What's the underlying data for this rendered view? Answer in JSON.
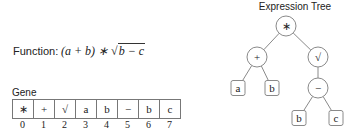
{
  "function": {
    "label": "Function:",
    "expression_prefix": "(a + b) ∗ ",
    "sqrt_symbol": "√",
    "radicand": "b − c"
  },
  "gene": {
    "title": "Gene",
    "cells": [
      "∗",
      "+",
      "√",
      "a",
      "b",
      "−",
      "b",
      "c"
    ],
    "indices": [
      "0",
      "1",
      "2",
      "3",
      "4",
      "5",
      "6",
      "7"
    ]
  },
  "tree": {
    "title": "Expression Tree",
    "nodes": [
      {
        "id": "root",
        "label": "∗",
        "shape": "circle",
        "x": 286,
        "y": 26
      },
      {
        "id": "plus",
        "label": "+",
        "shape": "circle",
        "x": 257,
        "y": 57
      },
      {
        "id": "sqrt",
        "label": "√",
        "shape": "circle",
        "x": 318,
        "y": 57
      },
      {
        "id": "a",
        "label": "a",
        "shape": "box",
        "x": 238,
        "y": 88
      },
      {
        "id": "b1",
        "label": "b",
        "shape": "box",
        "x": 272,
        "y": 88
      },
      {
        "id": "minus",
        "label": "−",
        "shape": "circle",
        "x": 318,
        "y": 88
      },
      {
        "id": "b2",
        "label": "b",
        "shape": "box",
        "x": 299,
        "y": 118
      },
      {
        "id": "c",
        "label": "c",
        "shape": "box",
        "x": 336,
        "y": 118
      }
    ],
    "edges": [
      [
        "root",
        "plus"
      ],
      [
        "root",
        "sqrt"
      ],
      [
        "plus",
        "a"
      ],
      [
        "plus",
        "b1"
      ],
      [
        "sqrt",
        "minus"
      ],
      [
        "minus",
        "b2"
      ],
      [
        "minus",
        "c"
      ]
    ]
  },
  "colors": {
    "stroke": "#8a8a8a",
    "text": "#222222",
    "background": "#ffffff"
  }
}
